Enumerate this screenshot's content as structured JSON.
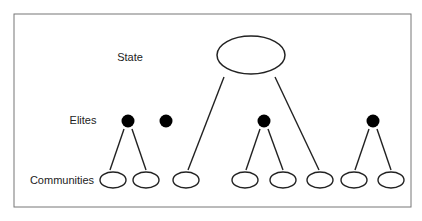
{
  "diagram": {
    "levels": {
      "state": "State",
      "elites": "Elites",
      "communities": "Communities"
    },
    "colors": {
      "stroke": "#222222",
      "frame": "#777777",
      "elite_fill": "#000000",
      "background": "#ffffff"
    },
    "nodes": {
      "state": {
        "cx": 251,
        "cy": 55,
        "rx": 34,
        "ry": 19
      },
      "elites": [
        {
          "cx": 128,
          "cy": 121
        },
        {
          "cx": 166,
          "cy": 121
        },
        {
          "cx": 264,
          "cy": 121
        },
        {
          "cx": 373,
          "cy": 121
        }
      ],
      "communities": [
        {
          "cx": 113,
          "cy": 180
        },
        {
          "cx": 146,
          "cy": 180
        },
        {
          "cx": 186,
          "cy": 180
        },
        {
          "cx": 245,
          "cy": 180
        },
        {
          "cx": 283,
          "cy": 180
        },
        {
          "cx": 320,
          "cy": 180
        },
        {
          "cx": 354,
          "cy": 180
        },
        {
          "cx": 391,
          "cy": 180
        }
      ]
    },
    "edges": [
      {
        "from": "state",
        "to": "community-3"
      },
      {
        "from": "state",
        "to": "community-6"
      },
      {
        "from": "elite-1",
        "to": "community-1"
      },
      {
        "from": "elite-1",
        "to": "community-2"
      },
      {
        "from": "elite-3",
        "to": "community-4"
      },
      {
        "from": "elite-3",
        "to": "community-5"
      },
      {
        "from": "elite-4",
        "to": "community-7"
      },
      {
        "from": "elite-4",
        "to": "community-8"
      }
    ]
  }
}
